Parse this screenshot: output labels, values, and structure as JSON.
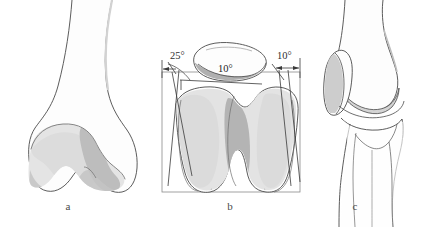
{
  "figure": {
    "background_color": "#ffffff",
    "ink_color": "#4a4a4a",
    "shading": {
      "cartilage_light": "#e2e2e2",
      "cartilage_mid": "#cfcfcf",
      "cartilage_dark": "#b2b2b2",
      "bone_fill": "#fdfdfd"
    }
  },
  "panels": [
    {
      "id": "a",
      "caption": "a",
      "view": "anterior view of distal femur",
      "annotations": []
    },
    {
      "id": "b",
      "caption": "b",
      "view": "axial (distal) view of femoral trochlea with patella",
      "has_frame": true,
      "annotations": [
        {
          "name": "lateral-facet-angle",
          "label": "25°",
          "position": "left"
        },
        {
          "name": "patella-angle",
          "label": "10°",
          "position": "center"
        },
        {
          "name": "medial-facet-angle",
          "label": "10°",
          "position": "right"
        }
      ]
    },
    {
      "id": "c",
      "caption": "c",
      "view": "lateral view of knee joint",
      "annotations": []
    }
  ],
  "labels": {
    "caption_a": "a",
    "caption_b": "b",
    "caption_c": "c",
    "angle_left": "25°",
    "angle_patella": "10°",
    "angle_right": "10°"
  }
}
